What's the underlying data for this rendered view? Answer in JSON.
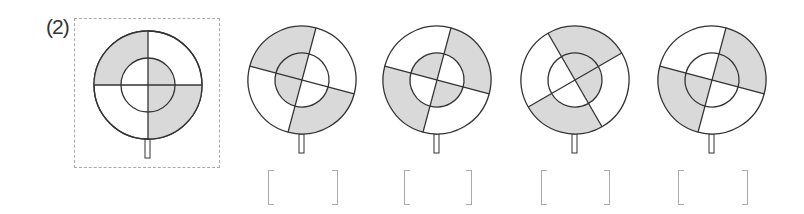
{
  "problem": {
    "label": "(2)",
    "colors": {
      "shade": "#d9d9d9",
      "line": "#333333",
      "bracket": "#aaaaaa"
    }
  },
  "figures": [
    {
      "id": "reference",
      "cx": 148,
      "cy": 85,
      "r_outer": 54,
      "r_inner": 27,
      "rotation_deg": 0,
      "outer_shaded": [
        "top-left",
        "bottom-right"
      ],
      "inner_shaded": [
        "top-right",
        "bottom-right"
      ]
    },
    {
      "id": "option-1",
      "cx": 302,
      "cy": 80,
      "r_outer": 54,
      "r_inner": 27,
      "rotation_deg": 15,
      "outer_shaded": [
        "top-left",
        "bottom-right"
      ],
      "inner_shaded": [
        "top-left",
        "bottom-left"
      ]
    },
    {
      "id": "option-2",
      "cx": 437,
      "cy": 80,
      "r_outer": 54,
      "r_inner": 27,
      "rotation_deg": -75,
      "outer_shaded": [
        "top-right",
        "bottom-left"
      ],
      "inner_shaded": [
        "top-left",
        "bottom-right"
      ]
    },
    {
      "id": "option-3",
      "cx": 575,
      "cy": 80,
      "r_outer": 54,
      "r_inner": 27,
      "rotation_deg": 45,
      "outer_shaded": [
        "right",
        "left"
      ],
      "inner_shaded": [
        "right",
        "bottom"
      ]
    },
    {
      "id": "option-4",
      "cx": 712,
      "cy": 80,
      "r_outer": 54,
      "r_inner": 27,
      "rotation_deg": -75,
      "outer_shaded": [
        "top-right",
        "bottom-left"
      ],
      "inner_shaded": [
        "top-right",
        "bottom-left"
      ]
    }
  ],
  "answer_brackets": [
    {
      "left": 268,
      "right": 338,
      "value": ""
    },
    {
      "left": 404,
      "right": 472,
      "value": ""
    },
    {
      "left": 541,
      "right": 610,
      "value": ""
    },
    {
      "left": 678,
      "right": 748,
      "value": ""
    }
  ]
}
